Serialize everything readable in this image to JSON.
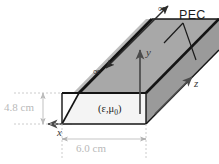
{
  "figure": {
    "colors": {
      "face_top": "#a8a8a8",
      "face_right": "#9a9a9a",
      "face_front": "#f2f2f2",
      "outline": "#1a1a1a",
      "dimension_line": "#c6c6c6",
      "dimension_text": "#b9b9b9",
      "axis": "#4a4a4a",
      "label_text": "#1c1c1c"
    }
  },
  "labels": {
    "pec": "PEC",
    "material": "(ε,μ",
    "material_sub": "0",
    "material_close": ")",
    "infinity_upper": "∞",
    "infinity_lower": "∞"
  },
  "axes": {
    "x": "x",
    "y": "y",
    "z": "z"
  },
  "dimensions": {
    "height": "4.8 cm",
    "width": "6.0 cm"
  }
}
